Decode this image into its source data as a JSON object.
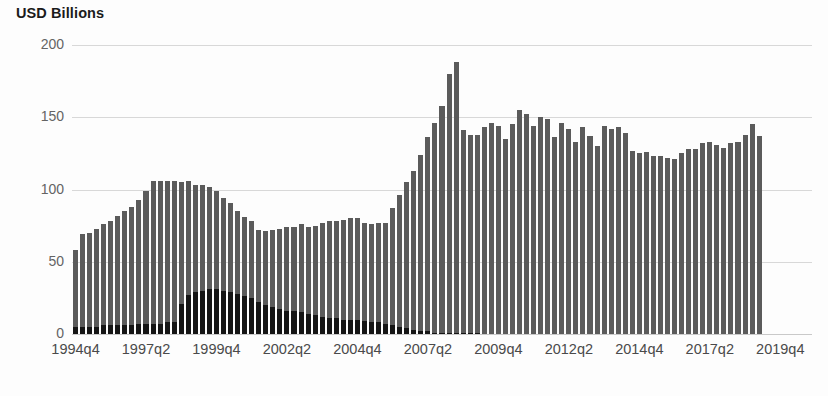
{
  "chart_data": {
    "type": "bar",
    "title": "USD Billions",
    "subtitle": "",
    "xlabel": "",
    "ylabel": "USD Billions",
    "ylim": [
      0,
      200
    ],
    "yticks": [
      0,
      50,
      100,
      150,
      200
    ],
    "ytick_labels": [
      "0",
      "50",
      "100",
      "150",
      "200"
    ],
    "grid": true,
    "legend": "none",
    "stacked": true,
    "bar_color_top": "#5b5b5b",
    "bar_color_bottom": "#151515",
    "gridline_color": "#d8d8d8",
    "background_color": "#fdfdfd",
    "xtick_labels": [
      "1994q4",
      "1997q2",
      "1999q4",
      "2002q2",
      "2004q4",
      "2007q2",
      "2009q4",
      "2012q2",
      "2014q4",
      "2017q2",
      "2019q4"
    ],
    "xtick_indices": [
      0,
      10,
      20,
      30,
      40,
      50,
      60,
      70,
      80,
      90,
      100
    ],
    "categories": [
      "1994q4",
      "1995q1",
      "1995q2",
      "1995q3",
      "1995q4",
      "1996q1",
      "1996q2",
      "1996q3",
      "1996q4",
      "1997q1",
      "1997q2",
      "1997q3",
      "1997q4",
      "1998q1",
      "1998q2",
      "1998q3",
      "1998q4",
      "1999q1",
      "1999q2",
      "1999q3",
      "1999q4",
      "2000q1",
      "2000q2",
      "2000q3",
      "2000q4",
      "2001q1",
      "2001q2",
      "2001q3",
      "2001q4",
      "2002q1",
      "2002q2",
      "2002q3",
      "2002q4",
      "2003q1",
      "2003q2",
      "2003q3",
      "2003q4",
      "2004q1",
      "2004q2",
      "2004q3",
      "2004q4",
      "2005q1",
      "2005q2",
      "2005q3",
      "2005q4",
      "2006q1",
      "2006q2",
      "2006q3",
      "2006q4",
      "2007q1",
      "2007q2",
      "2007q3",
      "2007q4",
      "2008q1",
      "2008q2",
      "2008q3",
      "2008q4",
      "2009q1",
      "2009q2",
      "2009q3",
      "2009q4",
      "2010q1",
      "2010q2",
      "2010q3",
      "2010q4",
      "2011q1",
      "2011q2",
      "2011q3",
      "2011q4",
      "2012q1",
      "2012q2",
      "2012q3",
      "2012q4",
      "2013q1",
      "2013q2",
      "2013q3",
      "2013q4",
      "2014q1",
      "2014q2",
      "2014q3",
      "2014q4",
      "2015q1",
      "2015q2",
      "2015q3",
      "2015q4",
      "2016q1",
      "2016q2",
      "2016q3",
      "2016q4",
      "2017q1",
      "2017q2",
      "2017q3",
      "2017q4",
      "2018q1",
      "2018q2",
      "2018q3",
      "2018q4",
      "2019q1",
      "2019q2",
      "2019q3",
      "2019q4",
      "2020q1",
      "2020q2",
      "2020q3",
      "2020q4"
    ],
    "series": [
      {
        "name": "lower-segment",
        "color": "#151515",
        "values": [
          5,
          5,
          5,
          5,
          6,
          6,
          6,
          6,
          6,
          7,
          7,
          7,
          7,
          8,
          8,
          21,
          27,
          29,
          30,
          31,
          31,
          30,
          29,
          28,
          26,
          25,
          22,
          20,
          19,
          17,
          16,
          16,
          15,
          14,
          13,
          12,
          11,
          11,
          10,
          10,
          10,
          9,
          8,
          8,
          7,
          6,
          5,
          4,
          3,
          2,
          2,
          1,
          1,
          1,
          1,
          1,
          1,
          1,
          0,
          0,
          0,
          0,
          0,
          0,
          0,
          0,
          0,
          0,
          0,
          0,
          0,
          0,
          0,
          0,
          0,
          0,
          0,
          0,
          0,
          0,
          0,
          0,
          0,
          0,
          0,
          0,
          0,
          0,
          0,
          0,
          0,
          0,
          0,
          0,
          0,
          0,
          0,
          0,
          0,
          0,
          0,
          0,
          0,
          0,
          0
        ]
      },
      {
        "name": "upper-segment",
        "color": "#5b5b5b",
        "values": [
          53,
          64,
          65,
          68,
          70,
          72,
          76,
          79,
          82,
          86,
          92,
          99,
          99,
          98,
          98,
          84,
          79,
          74,
          73,
          71,
          68,
          64,
          62,
          57,
          55,
          53,
          50,
          51,
          53,
          56,
          58,
          58,
          61,
          60,
          62,
          65,
          67,
          67,
          69,
          70,
          70,
          68,
          68,
          69,
          70,
          81,
          91,
          101,
          110,
          122,
          134,
          145,
          157,
          179,
          187,
          140,
          137,
          137,
          143,
          146,
          144,
          135,
          145,
          155,
          152,
          144,
          150,
          149,
          136,
          146,
          142,
          133,
          143,
          137,
          130,
          144,
          142,
          143,
          139,
          127,
          125,
          126,
          123,
          123,
          122,
          121,
          125,
          128,
          128,
          132,
          133,
          131,
          129,
          132,
          133,
          138,
          145,
          137,
          0,
          0,
          0,
          0,
          0,
          0,
          0
        ]
      }
    ],
    "totals": [
      58,
      69,
      70,
      73,
      76,
      78,
      82,
      85,
      88,
      93,
      99,
      106,
      106,
      106,
      106,
      105,
      106,
      103,
      103,
      102,
      99,
      94,
      91,
      85,
      81,
      78,
      72,
      71,
      72,
      73,
      74,
      74,
      76,
      74,
      75,
      77,
      78,
      78,
      79,
      80,
      80,
      77,
      76,
      77,
      77,
      87,
      96,
      105,
      113,
      124,
      136,
      146,
      158,
      180,
      188,
      141,
      138,
      138,
      143,
      146,
      144,
      135,
      145,
      155,
      152,
      144,
      150,
      149,
      136,
      146,
      142,
      133,
      143,
      137,
      130,
      144,
      142,
      143,
      139,
      127,
      125,
      126,
      123,
      123,
      122,
      121,
      125,
      128,
      128,
      132,
      133,
      131,
      129,
      132,
      133,
      138,
      145,
      137,
      0,
      0,
      0,
      0,
      0,
      0,
      0
    ]
  }
}
